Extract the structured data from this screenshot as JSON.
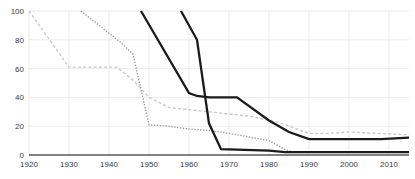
{
  "chart_data": {
    "type": "line",
    "title": "",
    "subtitle": "",
    "xlabel": "",
    "ylabel": "",
    "xlim": [
      1920,
      2015
    ],
    "ylim": [
      0,
      100
    ],
    "grid": true,
    "legend_position": "none",
    "x_ticks": [
      1920,
      1930,
      1940,
      1950,
      1960,
      1970,
      1980,
      1990,
      2000,
      2010
    ],
    "x_tick_labels": [
      "1920",
      "1930",
      "1940",
      "1950",
      "1960",
      "1970",
      "1980",
      "1990",
      "2000",
      "2010"
    ],
    "y_ticks": [
      0,
      20,
      40,
      60,
      80,
      100
    ],
    "y_tick_labels": [
      "0",
      "20",
      "40",
      "60",
      "80",
      "100"
    ],
    "series": [
      {
        "name": "series-1",
        "style": "dashed",
        "color": "#c9c9c9",
        "width": 1.4,
        "dash": "3,2.2",
        "x": [
          1920,
          1930,
          1942,
          1946,
          1950,
          1955,
          1965,
          1975,
          1982,
          1986,
          1990,
          1995,
          2000,
          2007,
          2015
        ],
        "y": [
          100,
          61,
          61,
          52,
          40,
          33,
          30,
          27,
          23,
          19,
          15,
          15,
          16,
          15,
          14
        ]
      },
      {
        "name": "series-2",
        "style": "dotted",
        "color": "#9a9a9a",
        "width": 1.4,
        "dash": "1.3,1.6",
        "x": [
          1933,
          1943,
          1946,
          1950,
          1955,
          1960,
          1965,
          1970,
          1976,
          1980,
          1984,
          1986,
          1990,
          2000,
          2015
        ],
        "y": [
          100,
          78,
          70,
          21,
          20,
          18,
          17,
          15,
          12,
          10,
          4,
          2,
          2,
          2,
          2
        ]
      },
      {
        "name": "series-3",
        "style": "solid",
        "color": "#1b1b1b",
        "width": 2.3,
        "dash": "",
        "x": [
          1948,
          1960,
          1962,
          1965,
          1972,
          1980,
          1985,
          1990,
          2000,
          2008,
          2015
        ],
        "y": [
          100,
          43,
          41,
          40,
          40,
          24,
          16,
          11,
          11,
          11,
          12
        ]
      },
      {
        "name": "series-4",
        "style": "solid",
        "color": "#1b1b1b",
        "width": 2.3,
        "dash": "",
        "x": [
          1958,
          1962,
          1965,
          1968,
          1980,
          1984,
          1990,
          2000,
          2015
        ],
        "y": [
          100,
          80,
          22,
          4,
          3,
          2,
          2,
          2,
          2
        ]
      }
    ]
  },
  "plot": {
    "left": 29,
    "right": 409,
    "top": 11,
    "bottom": 155
  }
}
